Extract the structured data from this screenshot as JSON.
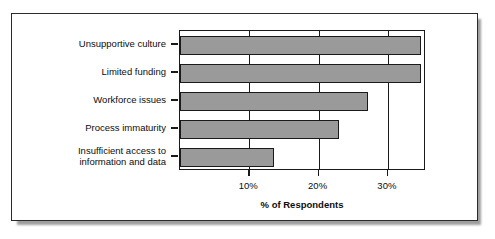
{
  "chart_data": {
    "type": "bar",
    "orientation": "horizontal",
    "title": "",
    "xlabel": "% of Respondents",
    "ylabel": "",
    "categories": [
      "Unsupportive culture",
      "Limited funding",
      "Workforce issues",
      "Process immaturity",
      "Insufficient access to\ninformation and data"
    ],
    "values": [
      34.8,
      34.8,
      27.1,
      23.0,
      13.6
    ],
    "xlim": [
      0,
      35.5
    ],
    "xticks": [
      10,
      20,
      30
    ],
    "xticklabels": [
      "10%",
      "20%",
      "30%"
    ],
    "grid": true,
    "gridlines_axis": "x",
    "legend": null,
    "bar_fill_color": "#9a9a9a",
    "bar_edge_color": "#1a1a1a",
    "axis_color": "#1a1a1a",
    "background_color": "#ffffff",
    "frame_border_color": "#2b2b2b"
  },
  "figure": {
    "xaxis_title": "% of Respondents"
  }
}
